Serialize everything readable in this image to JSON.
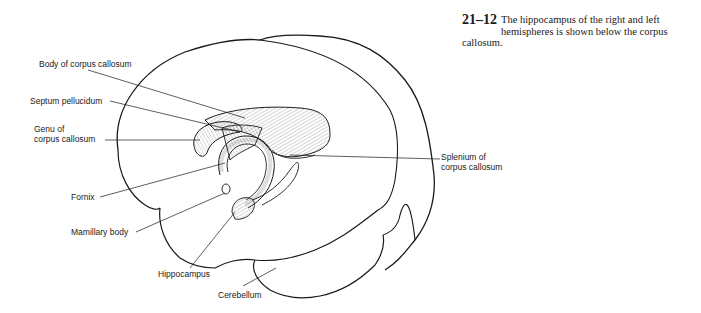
{
  "figure": {
    "number": "21–12",
    "caption_line1": "The hippocampus of the right and left",
    "caption_line2": "hemispheres is shown below the corpus",
    "caption_line3": "callosum."
  },
  "labels": {
    "body_corpus_callosum": "Body of corpus callosum",
    "septum_pellucidum": "Septum pellucidum",
    "genu_line1": "Genu of",
    "genu_line2": "corpus callosum",
    "fornix": "Fornix",
    "mamillary_body": "Mamillary body",
    "hippocampus": "Hippocampus",
    "cerebellum": "Cerebellum",
    "splenium_line1": "Splenium of",
    "splenium_line2": "corpus callosum"
  },
  "colors": {
    "ink": "#1a1a1a",
    "background": "#ffffff"
  }
}
